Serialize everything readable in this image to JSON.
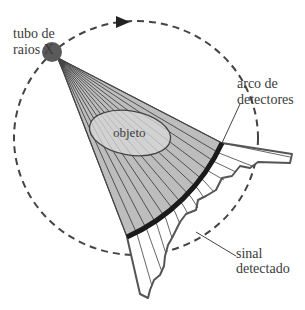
{
  "diagram": {
    "labels": {
      "tube_line1": "tubo de",
      "tube_line2": "raios X",
      "object": "objeto",
      "detectors_line1": "arco de",
      "detectors_line2": "detectores",
      "signal_line1": "sinal",
      "signal_line2": "detectado"
    },
    "colors": {
      "fan_fill": "#bdbdbd",
      "object_fill": "#d9d9d9",
      "lines": "#444444",
      "detector_arc": "#1a1a1a",
      "tube": "#555555",
      "text": "#3a3a3a"
    },
    "nodes": [
      {
        "id": "tube",
        "label": "tubo de raios X"
      },
      {
        "id": "object",
        "label": "objeto"
      },
      {
        "id": "detectors",
        "label": "arco de detectores"
      },
      {
        "id": "signal",
        "label": "sinal detectado"
      }
    ],
    "edges": [
      {
        "from": "tube",
        "to": "object",
        "label": "feixe em leque"
      },
      {
        "from": "object",
        "to": "detectors"
      },
      {
        "from": "detectors",
        "to": "signal"
      }
    ],
    "rotation_path": "dashed circular orbit with clockwise arrow"
  }
}
